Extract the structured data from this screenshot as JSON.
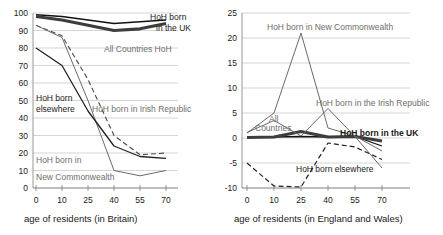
{
  "charts": [
    {
      "id": "britain",
      "caption": "age of residents (in Britain)",
      "chart_data": {
        "type": "line",
        "title": "",
        "xlabel": "age of residents (in Britain)",
        "ylabel": "",
        "x": [
          0,
          10,
          25,
          40,
          55,
          70
        ],
        "xticks": [
          "0",
          "10",
          "25",
          "40",
          "55",
          "70"
        ],
        "yticks": [
          "0",
          "10",
          "20",
          "30",
          "40",
          "50",
          "60",
          "70",
          "80",
          "90",
          "100"
        ],
        "xlim": [
          0,
          70
        ],
        "ylim": [
          0,
          100
        ],
        "grid": true,
        "legend": "inline-annotations",
        "series": [
          {
            "name": "HoH born in the UK",
            "values": [
              99,
              98,
              96,
              94,
              95,
              96
            ],
            "color": "#111111",
            "width": 1.4,
            "dash": "none"
          },
          {
            "name": "All Countries HoH",
            "values": [
              98,
              96,
              93,
              90,
              91,
              94
            ],
            "color": "#3d3d3d",
            "width": 3.2,
            "dash": "none"
          },
          {
            "name": "HoH born in Irish Republic",
            "values": [
              93,
              87,
              62,
              30,
              19,
              20
            ],
            "color": "#4a4a4a",
            "width": 1.1,
            "dash": "5,3"
          },
          {
            "name": "HoH born in New Commonwealth",
            "values": [
              93,
              86,
              50,
              10,
              7,
              10
            ],
            "color": "#6a6a6a",
            "width": 1.0,
            "dash": "none"
          },
          {
            "name": "HoH born elsewhere",
            "values": [
              80,
              70,
              44,
              24,
              18,
              17
            ],
            "color": "#222222",
            "width": 1.3,
            "dash": "none"
          }
        ],
        "annotations": [
          {
            "text": "HoH born",
            "x": 150,
            "y": 20,
            "style": "plain"
          },
          {
            "text": "in the UK",
            "x": 156,
            "y": 31,
            "style": "plain"
          },
          {
            "text": "All Countries HoH",
            "x": 104,
            "y": 52,
            "style": "grey"
          },
          {
            "text": "HoH born",
            "x": 36,
            "y": 101,
            "style": "plain"
          },
          {
            "text": "elsewhere",
            "x": 36,
            "y": 112,
            "style": "plain"
          },
          {
            "text": "HoH born in Irish Republic",
            "x": 92,
            "y": 112,
            "style": "grey"
          },
          {
            "text": "HoH born in",
            "x": 36,
            "y": 163,
            "style": "grey"
          },
          {
            "text": "New Commonwealth",
            "x": 36,
            "y": 180,
            "style": "grey"
          }
        ]
      }
    },
    {
      "id": "england-wales",
      "caption": "age of residents (in England and Wales)",
      "chart_data": {
        "type": "line",
        "title": "",
        "xlabel": "age of residents (in England and Wales)",
        "ylabel": "",
        "x": [
          0,
          10,
          25,
          40,
          55,
          70
        ],
        "xticks": [
          "0",
          "10",
          "25",
          "40",
          "55",
          "70"
        ],
        "yticks": [
          "-10",
          "-5",
          "0",
          "5",
          "10",
          "15",
          "20",
          "25"
        ],
        "xlim": [
          0,
          70
        ],
        "ylim": [
          -10,
          25
        ],
        "grid": true,
        "legend": "inline-annotations",
        "series": [
          {
            "name": "HoH born in the UK",
            "values": [
              0.2,
              0.2,
              0.3,
              0.2,
              0.3,
              -1.6
            ],
            "color": "#111111",
            "width": 1.3,
            "dash": "none"
          },
          {
            "name": "All Countries",
            "values": [
              0.1,
              0.2,
              1.3,
              0.2,
              0.3,
              -0.6
            ],
            "color": "#3d3d3d",
            "width": 3.0,
            "dash": "none"
          },
          {
            "name": "HoH born in the Irish Republic",
            "values": [
              1.1,
              3.5,
              0.4,
              5.9,
              0.3,
              -6.0
            ],
            "color": "#6a6a6a",
            "width": 1.0,
            "dash": "none"
          },
          {
            "name": "HoH born in New Commonwealth",
            "values": [
              1.0,
              5.0,
              21.0,
              2.0,
              0.4,
              -2.6
            ],
            "color": "#6a6a6a",
            "width": 1.0,
            "dash": "none"
          },
          {
            "name": "HoH born elsewhere",
            "values": [
              -5.0,
              -9.6,
              -9.8,
              -1.0,
              -1.8,
              -4.3
            ],
            "color": "#222222",
            "width": 1.2,
            "dash": "5,3"
          }
        ],
        "annotations": [
          {
            "text": "HoH born in New Commonwealth",
            "x": 47,
            "y": 30,
            "style": "grey"
          },
          {
            "text": "HoH born in the Irish Republic",
            "x": 96,
            "y": 106,
            "style": "grey"
          },
          {
            "text": "All",
            "x": 49,
            "y": 122,
            "style": "grey"
          },
          {
            "text": "Countries",
            "x": 35,
            "y": 131,
            "style": "grey"
          },
          {
            "text": "HoH born in the UK",
            "x": 120,
            "y": 136,
            "style": "bold"
          },
          {
            "text": "HoH born elsewhere",
            "x": 76,
            "y": 172,
            "style": "plain"
          }
        ]
      }
    }
  ]
}
